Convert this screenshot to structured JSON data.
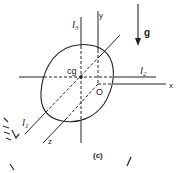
{
  "figure": {
    "caption": "(c)",
    "labels": {
      "l1": "l",
      "l1_sub": "1",
      "l2": "l",
      "l2_sub": "2",
      "l3": "l",
      "l3_sub": "3",
      "cg": "cg",
      "origin": "O",
      "x_axis": "x",
      "y_axis": "y",
      "z_axis": "z",
      "gravity": "g"
    },
    "colors": {
      "line": "#222222",
      "background": "#ffffff"
    }
  }
}
